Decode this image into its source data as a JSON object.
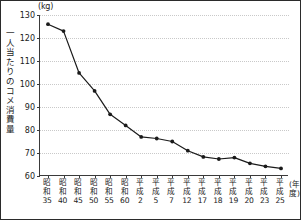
{
  "chart_data": {
    "type": "line",
    "title": "",
    "subtitle": "",
    "unit_label": "(kg)",
    "ylabel": "一人当たりのコメ消費量",
    "xlabel": "(年度)",
    "ylim": [
      60,
      130
    ],
    "ytick_step": 10,
    "yticks": [
      130,
      120,
      110,
      100,
      90,
      80,
      70,
      60
    ],
    "grid": true,
    "legend": false,
    "legend_position": "none",
    "marker": "filled-circle",
    "line_color": "#1a1a1a",
    "grid_color": "#c9c9c9",
    "categories": [
      "昭和35",
      "昭和40",
      "昭和45",
      "昭和50",
      "昭和55",
      "昭和60",
      "平成2",
      "平成5",
      "平成7",
      "平成12",
      "平成17",
      "平成18",
      "平成19",
      "平成20",
      "平成23",
      "平成25"
    ],
    "category_parts": [
      {
        "era": "昭和",
        "num": "35"
      },
      {
        "era": "昭和",
        "num": "40"
      },
      {
        "era": "昭和",
        "num": "45"
      },
      {
        "era": "昭和",
        "num": "50"
      },
      {
        "era": "昭和",
        "num": "55"
      },
      {
        "era": "昭和",
        "num": "60"
      },
      {
        "era": "平成",
        "num": "2"
      },
      {
        "era": "平成",
        "num": "5"
      },
      {
        "era": "平成",
        "num": "7"
      },
      {
        "era": "平成",
        "num": "12"
      },
      {
        "era": "平成",
        "num": "17"
      },
      {
        "era": "平成",
        "num": "18"
      },
      {
        "era": "平成",
        "num": "19"
      },
      {
        "era": "平成",
        "num": "20"
      },
      {
        "era": "平成",
        "num": "23"
      },
      {
        "era": "平成",
        "num": "25"
      }
    ],
    "values": [
      126.0,
      123.0,
      104.8,
      97.0,
      86.8,
      82.0,
      77.0,
      76.3,
      75.0,
      71.0,
      68.3,
      67.4,
      68.0,
      65.5,
      64.2,
      63.3
    ]
  }
}
